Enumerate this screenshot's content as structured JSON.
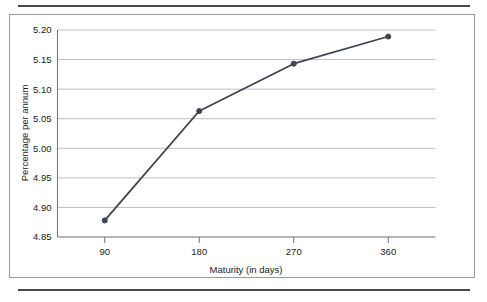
{
  "figure": {
    "background_color": "#ffffff",
    "frame_color": "#9a9a9a",
    "rule_color": "#4a4a4a"
  },
  "chart_data": {
    "type": "line",
    "title": "",
    "subtitle": "",
    "xlabel": "Maturity (in days)",
    "ylabel": "Percentage per annum",
    "x": [
      90,
      180,
      270,
      360
    ],
    "categories": [
      "90",
      "180",
      "270",
      "360"
    ],
    "values": [
      4.878,
      5.063,
      5.143,
      5.189
    ],
    "series": [
      {
        "name": "Percentage per annum",
        "values": [
          4.878,
          5.063,
          5.143,
          5.189
        ],
        "color": "#3d4450",
        "marker": "circle",
        "marker_color": "#3d4450",
        "line_width": 1.8
      }
    ],
    "xlim": [
      45,
      405
    ],
    "ylim": [
      4.85,
      5.2
    ],
    "xticks": [
      90,
      180,
      270,
      360
    ],
    "xtick_labels": [
      "90",
      "180",
      "270",
      "360"
    ],
    "yticks": [
      4.85,
      4.9,
      4.95,
      5.0,
      5.05,
      5.1,
      5.15,
      5.2
    ],
    "ytick_labels": [
      "4.85",
      "4.90",
      "4.95",
      "5.00",
      "5.05",
      "5.10",
      "5.15",
      "5.20"
    ],
    "grid": true,
    "grid_axis": "y",
    "grid_color": "#bfbfbf",
    "legend": false,
    "legend_position": "none",
    "annotations": []
  }
}
